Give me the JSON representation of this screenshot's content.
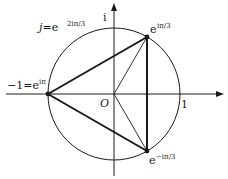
{
  "diagram": {
    "colors": {
      "stroke": "#1a1a1a",
      "background": "#ffffff"
    },
    "axes": {
      "real_axis_label": "1",
      "imag_axis_label": "i",
      "origin_label": "O"
    },
    "labels": {
      "j_prefix": "j=e",
      "j_exp": "2iπ/3",
      "minus_one_prefix": "−1=e",
      "minus_one_exp": "iπ",
      "top_base": "e",
      "top_exp": "iπ/3",
      "bottom_base": "e",
      "bottom_exp": "−iπ/3"
    },
    "points": [
      {
        "name": "-1",
        "label": "−1=e^{iπ}"
      },
      {
        "name": "e^{iπ/3}",
        "label": "e^{iπ/3}"
      },
      {
        "name": "e^{-iπ/3}",
        "label": "e^{−iπ/3}"
      }
    ],
    "shapes": {
      "circle": "unit circle centered at O",
      "triangle": "thick triangle joining −1, e^{iπ/3}, e^{−iπ/3}",
      "chord": "vertical segment e^{iπ/3} to e^{−iπ/3}",
      "radii": "thin segments O to e^{iπ/3} and O to e^{−iπ/3}"
    }
  }
}
